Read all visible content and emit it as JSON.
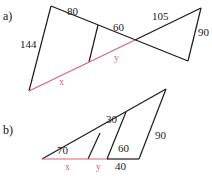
{
  "colors": {
    "line": "#1a1a1a",
    "unknown_line": "#d9607a"
  },
  "figures": [
    {
      "label": "a)",
      "given_lengths": [
        "80",
        "60",
        "105",
        "144",
        "90"
      ],
      "unknowns": [
        "x",
        "y"
      ]
    },
    {
      "label": "b)",
      "given_lengths": [
        "70",
        "30",
        "60",
        "90",
        "40"
      ],
      "unknowns": [
        "x",
        "y"
      ]
    }
  ]
}
